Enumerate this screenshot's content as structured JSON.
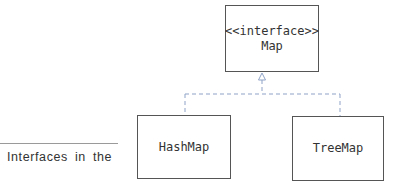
{
  "diagram": {
    "type": "uml-class-hierarchy",
    "interface": {
      "stereotype": "<<interface>>",
      "name": "Map"
    },
    "implementations": [
      {
        "name": "HashMap"
      },
      {
        "name": "TreeMap"
      }
    ],
    "relationship": "realization (dashed line, hollow triangle arrow)",
    "connector_color": "#8fa3c8"
  },
  "caption": {
    "text": "Interfaces in the"
  }
}
